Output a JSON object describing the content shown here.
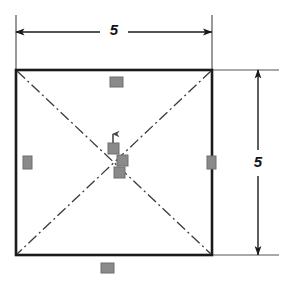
{
  "drawing": {
    "title": "Square outline with crossing centerlines and 5 x 5 dimensions",
    "colors": {
      "outline": "#1a1a1a",
      "centerline": "#3a3a3a",
      "dimension": "#1a1a1a",
      "extension": "#555555",
      "marker": "#8a8a8a",
      "marker_border": "#6e6e6e",
      "background": "#ffffff"
    },
    "shape": {
      "name": "square",
      "left": 16,
      "top": 70,
      "right": 212,
      "bottom": 255,
      "stroke_width": 2.6
    },
    "centerlines": {
      "style": "dash-dot",
      "count": 2,
      "description": "two diagonals crossing at the square center"
    },
    "center_point": {
      "x": 113,
      "y": 162
    },
    "dimensions": [
      {
        "id": "top",
        "value": "5",
        "orientation": "horizontal",
        "label_x": 114,
        "label_y": 32,
        "line_y": 32,
        "from_x": 16,
        "to_x": 212,
        "arrows": "both"
      },
      {
        "id": "right",
        "value": "5",
        "orientation": "vertical",
        "label_x": 258,
        "label_y": 163,
        "line_x": 258,
        "from_y": 70,
        "to_y": 255,
        "arrows": "both"
      }
    ],
    "extension_lines": [
      {
        "id": "left-vertical",
        "x1": 16,
        "y1": 15,
        "x2": 16,
        "y2": 70
      },
      {
        "id": "right-vertical",
        "x1": 212,
        "y1": 15,
        "x2": 212,
        "y2": 70
      },
      {
        "id": "top-horizontal",
        "x1": 212,
        "y1": 70,
        "x2": 279,
        "y2": 70
      },
      {
        "id": "bottom-horizontal",
        "x1": 212,
        "y1": 255,
        "x2": 279,
        "y2": 255
      }
    ],
    "markers": [
      {
        "id": "top-edge-marker",
        "x": 110,
        "y": 77,
        "w": 13,
        "h": 10,
        "shape": "rect-h"
      },
      {
        "id": "bottom-edge-marker",
        "x": 101,
        "y": 263,
        "w": 13,
        "h": 10,
        "shape": "rect-h"
      },
      {
        "id": "left-edge-marker",
        "x": 23,
        "y": 156,
        "w": 9,
        "h": 13,
        "shape": "rect-v"
      },
      {
        "id": "right-edge-marker",
        "x": 207,
        "y": 156,
        "w": 9,
        "h": 13,
        "shape": "rect-v"
      },
      {
        "id": "center-marker-upper",
        "x": 108,
        "y": 143,
        "w": 11,
        "h": 11,
        "shape": "rect-sq"
      },
      {
        "id": "center-marker-right",
        "x": 117,
        "y": 155,
        "w": 11,
        "h": 11,
        "shape": "rect-sq"
      },
      {
        "id": "center-marker-lower",
        "x": 114,
        "y": 167,
        "w": 11,
        "h": 11,
        "shape": "rect-sq"
      }
    ],
    "leader_arrow": {
      "id": "center-leader-arrow",
      "direction": "up",
      "x": 113,
      "tail_y": 146,
      "head_y": 133
    }
  }
}
